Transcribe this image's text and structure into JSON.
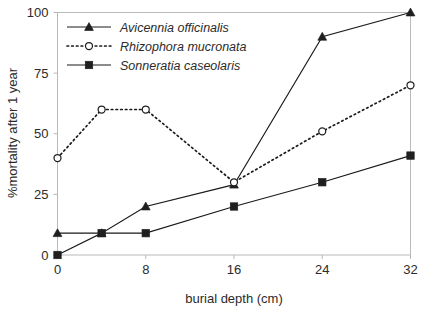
{
  "chart_data": {
    "type": "line",
    "title": "",
    "xlabel": "burial depth (cm)",
    "ylabel": "%mortality after 1 year",
    "x": [
      0,
      4,
      8,
      16,
      24,
      32
    ],
    "xlim": [
      0,
      32
    ],
    "ylim": [
      0,
      100
    ],
    "xticks": [
      "0",
      "8",
      "16",
      "24",
      "32"
    ],
    "xtick_values": [
      0,
      8,
      16,
      24,
      32
    ],
    "yticks": [
      "0",
      "25",
      "50",
      "75",
      "100"
    ],
    "ytick_values": [
      0,
      25,
      50,
      75,
      100
    ],
    "grid": false,
    "legend_position": "top-left-inside",
    "series": [
      {
        "name": "Avicennia officinalis",
        "values": [
          9,
          9,
          20,
          29,
          90,
          100
        ],
        "marker": "triangle-filled",
        "linestyle": "solid",
        "color": "#1a1a1a"
      },
      {
        "name": "Rhizophora mucronata",
        "values": [
          40,
          60,
          60,
          30,
          51,
          70
        ],
        "marker": "circle-open",
        "linestyle": "dotted",
        "color": "#1a1a1a"
      },
      {
        "name": "Sonneratia caseolaris",
        "values": [
          0,
          9,
          9,
          20,
          30,
          41
        ],
        "marker": "square-filled",
        "linestyle": "solid",
        "color": "#1a1a1a"
      }
    ]
  },
  "legend": {
    "items": [
      {
        "label": "Avicennia officinalis"
      },
      {
        "label": "Rhizophora mucronata"
      },
      {
        "label": "Sonneratia caseolaris"
      }
    ]
  },
  "axes": {
    "x_title": "burial depth (cm)",
    "y_title": "%mortality after 1 year",
    "x_tick_labels": [
      "0",
      "8",
      "16",
      "24",
      "32"
    ],
    "y_tick_labels": [
      "0",
      "25",
      "50",
      "75",
      "100"
    ]
  },
  "colors": {
    "ink": "#1a1a1a",
    "frame": "#b9b9b9",
    "background": "#ffffff"
  }
}
